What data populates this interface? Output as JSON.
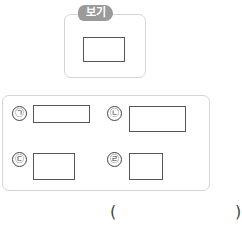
{
  "example": {
    "tag_label": "보기",
    "shape": {
      "type": "rectangle",
      "width": 42,
      "height": 25
    }
  },
  "options": [
    {
      "label": "㉠",
      "shape": {
        "type": "rectangle",
        "width": 57,
        "height": 18
      }
    },
    {
      "label": "㉡",
      "shape": {
        "type": "rectangle",
        "width": 57,
        "height": 26
      }
    },
    {
      "label": "㉢",
      "shape": {
        "type": "rectangle",
        "width": 42,
        "height": 27
      }
    },
    {
      "label": "㉣",
      "shape": {
        "type": "rectangle",
        "width": 34,
        "height": 27
      }
    }
  ],
  "answer": {
    "open_paren": "(",
    "close_paren": ")",
    "value": ""
  }
}
